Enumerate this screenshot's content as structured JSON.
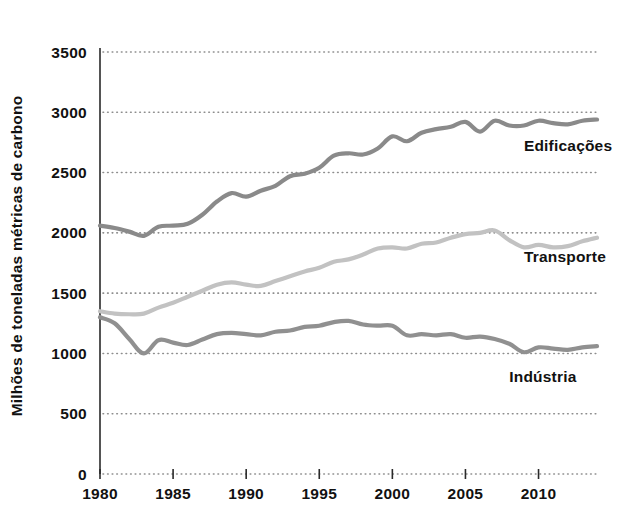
{
  "chart_data": {
    "type": "line",
    "title": "",
    "xlabel": "",
    "ylabel": "Milhões de toneladas métricas de carbono",
    "xlim": [
      1980,
      2014
    ],
    "ylim": [
      0,
      3500
    ],
    "grid": true,
    "legend_position": "inline-right",
    "y_ticks": [
      0,
      500,
      1000,
      1500,
      2000,
      2500,
      3000,
      3500
    ],
    "y_tick_labels": [
      "0",
      "500",
      "1000",
      "1500",
      "2000",
      "2500",
      "3000",
      "3500"
    ],
    "x_ticks": [
      1980,
      1985,
      1990,
      1995,
      2000,
      2005,
      2010
    ],
    "x_tick_labels": [
      "1980",
      "1985",
      "1990",
      "1995",
      "2000",
      "2005",
      "2010"
    ],
    "x": [
      1980,
      1981,
      1982,
      1983,
      1984,
      1985,
      1986,
      1987,
      1988,
      1989,
      1990,
      1991,
      1992,
      1993,
      1994,
      1995,
      1996,
      1997,
      1998,
      1999,
      2000,
      2001,
      2002,
      2003,
      2004,
      2005,
      2006,
      2007,
      2008,
      2009,
      2010,
      2011,
      2012,
      2013,
      2014
    ],
    "series": [
      {
        "name": "Edificações",
        "color": "#8a8a8a",
        "label_year": 2009,
        "label_value": 2680,
        "values": [
          2060,
          2040,
          2010,
          1975,
          2050,
          2060,
          2075,
          2150,
          2260,
          2330,
          2300,
          2350,
          2390,
          2470,
          2490,
          2540,
          2640,
          2660,
          2650,
          2700,
          2800,
          2760,
          2830,
          2860,
          2880,
          2920,
          2840,
          2930,
          2890,
          2890,
          2930,
          2910,
          2900,
          2930,
          2940
        ]
      },
      {
        "name": "Transporte",
        "color": "#c2c2c2",
        "label_year": 2009,
        "label_value": 1760,
        "values": [
          1350,
          1330,
          1325,
          1330,
          1380,
          1420,
          1470,
          1520,
          1570,
          1590,
          1570,
          1560,
          1600,
          1640,
          1680,
          1710,
          1760,
          1780,
          1820,
          1870,
          1880,
          1870,
          1910,
          1920,
          1960,
          1990,
          2000,
          2020,
          1940,
          1880,
          1900,
          1880,
          1890,
          1930,
          1960
        ]
      },
      {
        "name": "Indústria",
        "color": "#909090",
        "label_year": 2008,
        "label_value": 760,
        "values": [
          1300,
          1250,
          1120,
          1000,
          1110,
          1090,
          1070,
          1115,
          1160,
          1170,
          1160,
          1150,
          1180,
          1190,
          1220,
          1230,
          1260,
          1270,
          1240,
          1230,
          1230,
          1150,
          1160,
          1150,
          1160,
          1130,
          1140,
          1120,
          1080,
          1010,
          1050,
          1040,
          1030,
          1050,
          1060
        ]
      }
    ]
  }
}
